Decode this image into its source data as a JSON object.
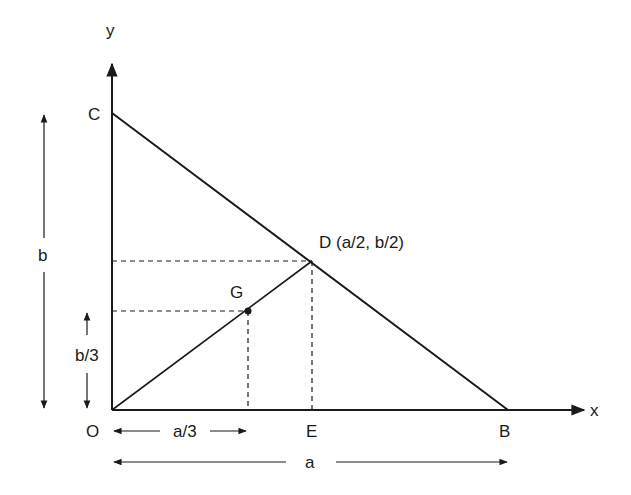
{
  "figure": {
    "axes": {
      "x_label": "x",
      "y_label": "y"
    },
    "points": {
      "O": {
        "label": "O"
      },
      "B": {
        "label": "B"
      },
      "C": {
        "label": "C"
      },
      "D": {
        "label": "D (a/2, b/2)"
      },
      "E": {
        "label": "E"
      },
      "G": {
        "label": "G"
      }
    },
    "dimensions": {
      "height_total": "b",
      "height_third": "b/3",
      "width_third": "a/3",
      "width_total": "a"
    },
    "colors": {
      "ink": "#1a1a1a",
      "background": "#ffffff"
    }
  }
}
